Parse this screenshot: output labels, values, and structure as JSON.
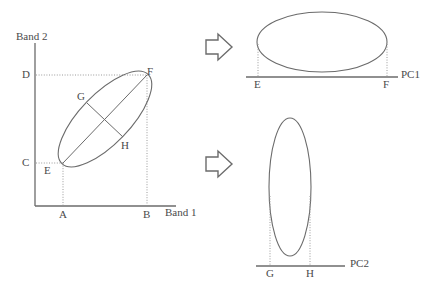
{
  "figure": {
    "title": "",
    "background": "#ffffff",
    "stroke_color": "#6b6b6b",
    "dotted_color": "#9a9a9a",
    "text_color": "#4a4a4a"
  },
  "scatter_plot": {
    "y_axis_label": "Band 2",
    "x_axis_label": "Band 1",
    "x_ticks": [
      {
        "label": "A",
        "x": 63
      },
      {
        "label": "B",
        "x": 147
      }
    ],
    "y_ticks": [
      {
        "label": "D",
        "y": 75
      },
      {
        "label": "C",
        "y": 163
      }
    ],
    "ellipse": {
      "center_x": 105,
      "center_y": 119,
      "semi_major": 62,
      "semi_minor": 25,
      "rotation_deg": -46
    },
    "points": [
      {
        "label": "E",
        "x": 63,
        "y": 163,
        "desc": "lower-left extreme of major axis"
      },
      {
        "label": "F",
        "x": 147,
        "y": 75,
        "desc": "upper-right extreme of major axis"
      },
      {
        "label": "G",
        "x": 87,
        "y": 103,
        "desc": "upper-left extreme of minor axis"
      },
      {
        "label": "H",
        "x": 123,
        "y": 137,
        "desc": "lower-right extreme of minor axis"
      }
    ]
  },
  "arrows": [
    {
      "name": "arrow-to-pc1",
      "x": 205,
      "y": 48
    },
    {
      "name": "arrow-to-pc2",
      "x": 205,
      "y": 163
    }
  ],
  "pc1_plot": {
    "axis_label": "PC1",
    "axis_y": 77,
    "axis_x_start": 246,
    "axis_x_end": 398,
    "ticks": [
      {
        "label": "E",
        "x": 258
      },
      {
        "label": "F",
        "x": 387
      }
    ],
    "ellipse": {
      "center_x": 322,
      "center_y": 42,
      "rx": 65,
      "ry": 30
    }
  },
  "pc2_plot": {
    "axis_label": "PC2",
    "axis_y": 266,
    "axis_x_start": 256,
    "axis_x_end": 345,
    "ticks": [
      {
        "label": "G",
        "x": 270
      },
      {
        "label": "H",
        "x": 310
      }
    ],
    "ellipse": {
      "center_x": 290,
      "center_y": 187,
      "rx": 21,
      "ry": 69
    }
  }
}
